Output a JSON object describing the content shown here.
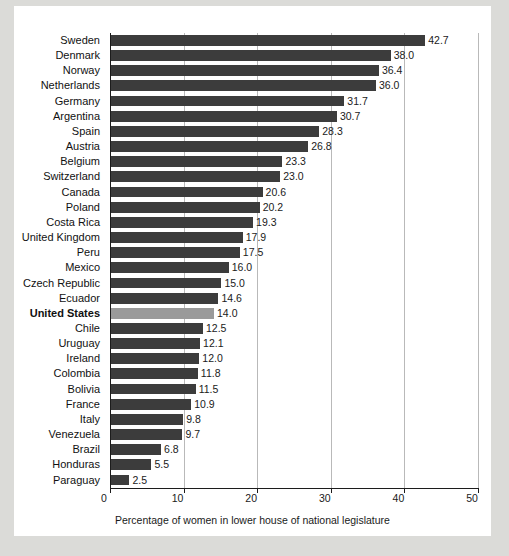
{
  "chart_data": {
    "type": "bar",
    "orientation": "horizontal",
    "title": "",
    "xlabel": "Percentage of women in lower house of national legislature",
    "ylabel": "",
    "xlim": [
      0,
      50
    ],
    "xticks": [
      0,
      10,
      20,
      30,
      40,
      50
    ],
    "grid": true,
    "legend": "none",
    "highlight_category": "United States",
    "colors": {
      "bar": "#3c3c3c",
      "bar_highlight": "#9a9a9a",
      "grid": "#b9b9b9",
      "axis": "#1c1c1c",
      "card_background": "#ffffff",
      "page_background": "#dbdbd8",
      "text": "#111111"
    },
    "categories": [
      "Sweden",
      "Denmark",
      "Norway",
      "Netherlands",
      "Germany",
      "Argentina",
      "Spain",
      "Austria",
      "Belgium",
      "Switzerland",
      "Canada",
      "Poland",
      "Costa Rica",
      "United Kingdom",
      "Peru",
      "Mexico",
      "Czech Republic",
      "Ecuador",
      "United States",
      "Chile",
      "Uruguay",
      "Ireland",
      "Colombia",
      "Bolivia",
      "France",
      "Italy",
      "Venezuela",
      "Brazil",
      "Honduras",
      "Paraguay"
    ],
    "values": [
      42.7,
      38.0,
      36.4,
      36.0,
      31.7,
      30.7,
      28.3,
      26.8,
      23.3,
      23.0,
      20.6,
      20.2,
      19.3,
      17.9,
      17.5,
      16.0,
      15.0,
      14.6,
      14.0,
      12.5,
      12.1,
      12.0,
      11.8,
      11.5,
      10.9,
      9.8,
      9.7,
      6.8,
      5.5,
      2.5
    ],
    "value_labels": [
      "42.7",
      "38.0",
      "36.4",
      "36.0",
      "31.7",
      "30.7",
      "28.3",
      "26.8",
      "23.3",
      "23.0",
      "20.6",
      "20.2",
      "19.3",
      "17.9",
      "17.5",
      "16.0",
      "15.0",
      "14.6",
      "14.0",
      "12.5",
      "12.1",
      "12.0",
      "11.8",
      "11.5",
      "10.9",
      "9.8",
      "9.7",
      "6.8",
      "5.5",
      "2.5"
    ],
    "xtick_labels": [
      "0",
      "10",
      "20",
      "30",
      "40",
      "50"
    ]
  }
}
